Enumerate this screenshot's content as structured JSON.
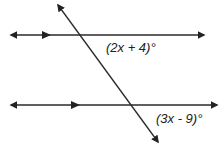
{
  "diagram": {
    "type": "parallel-lines-transversal",
    "labels": {
      "top_angle": "(2x + 4)°",
      "bottom_angle": "(3x - 9)°"
    },
    "colors": {
      "line": "#2a2a2a",
      "background": "#ffffff"
    }
  }
}
